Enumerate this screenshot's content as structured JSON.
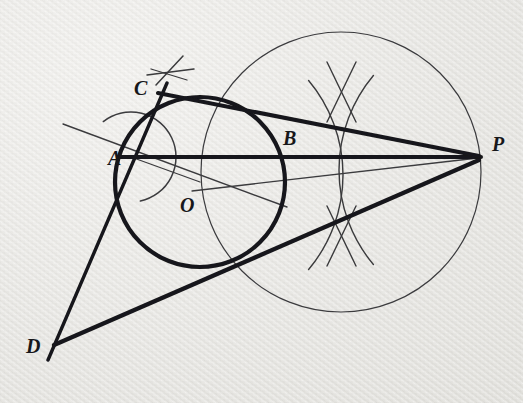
{
  "figure": {
    "kind": "geometry-construction-diagram",
    "background_color": "#ecebe8",
    "ink_color": "#1a1a1c",
    "thin_ink_color": "#3a3a3c"
  },
  "labels": [
    {
      "id": "C",
      "text": "C",
      "x": 134,
      "y": 78,
      "size": 20
    },
    {
      "id": "A",
      "text": "A",
      "x": 108,
      "y": 148,
      "size": 20
    },
    {
      "id": "B",
      "text": "B",
      "x": 283,
      "y": 128,
      "size": 20
    },
    {
      "id": "O",
      "text": "O",
      "x": 180,
      "y": 195,
      "size": 20
    },
    {
      "id": "P",
      "text": "P",
      "x": 492,
      "y": 134,
      "size": 20
    },
    {
      "id": "D",
      "text": "D",
      "x": 26,
      "y": 336,
      "size": 20
    }
  ],
  "points": {
    "A": {
      "x": 131,
      "y": 157
    },
    "B": {
      "x": 285,
      "y": 157
    },
    "O": {
      "x": 200,
      "y": 182
    },
    "C": {
      "x": 158,
      "y": 93
    },
    "D": {
      "x": 54,
      "y": 345
    },
    "P": {
      "x": 478,
      "y": 157
    }
  },
  "circles": [
    {
      "id": "main-circle",
      "name": "circle-O",
      "cx": 200,
      "cy": 182,
      "r": 85,
      "stroke_width": 4.2,
      "stroke": "#16161a",
      "style": "bold"
    },
    {
      "id": "auxiliary-circle",
      "name": "circle-on-OP-diameter",
      "cx": 341,
      "cy": 172,
      "r": 140,
      "stroke_width": 1.2,
      "stroke": "#3b3b3e",
      "style": "thin"
    }
  ],
  "segments": [
    {
      "id": "line-AP",
      "name": "diameter-line-A-to-P",
      "x1": 118,
      "y1": 157,
      "x2": 481,
      "y2": 157,
      "w": 4.0,
      "stroke": "#16161a"
    },
    {
      "id": "line-CP",
      "name": "tangent-line-C-to-P",
      "x1": 158,
      "y1": 93,
      "x2": 479,
      "y2": 156,
      "w": 4.0,
      "stroke": "#16161a"
    },
    {
      "id": "line-DP",
      "name": "tangent-line-D-to-P",
      "x1": 54,
      "y1": 345,
      "x2": 479,
      "y2": 160,
      "w": 4.2,
      "stroke": "#16161a"
    },
    {
      "id": "line-CD",
      "name": "secant-line-C-through-A-to-D",
      "x1": 167,
      "y1": 83,
      "x2": 48,
      "y2": 360,
      "w": 3.4,
      "stroke": "#16161a"
    },
    {
      "id": "line-OP-thin",
      "name": "thin-line-O-to-P",
      "x1": 192,
      "y1": 191,
      "x2": 478,
      "y2": 158,
      "w": 1.3,
      "stroke": "#3b3b3e"
    },
    {
      "id": "line-OA-thin",
      "name": "thin-line-O-to-A",
      "x1": 200,
      "y1": 182,
      "x2": 131,
      "y2": 157,
      "w": 1.3,
      "stroke": "#3b3b3e"
    },
    {
      "id": "line-through-A-thin",
      "name": "thin-ray-through-A",
      "x1": 63,
      "y1": 124,
      "x2": 287,
      "y2": 207,
      "w": 1.4,
      "stroke": "#3b3b3e"
    }
  ],
  "construction_arcs": [
    {
      "id": "arc-at-A",
      "name": "compass-arc-centred-at-A",
      "cx": 131,
      "cy": 157,
      "r": 45,
      "start_deg": -128,
      "end_deg": 78,
      "w": 1.5,
      "stroke": "#3b3b3e"
    }
  ],
  "construction_crosses": [
    {
      "id": "cross-above-C",
      "name": "compass-intersection-mark-above-C",
      "strokes": [
        {
          "x1": 147,
          "y1": 75,
          "x2": 194,
          "y2": 69,
          "w": 1.5
        },
        {
          "x1": 156,
          "y1": 85,
          "x2": 183,
          "y2": 56,
          "w": 1.5
        },
        {
          "x1": 151,
          "y1": 69,
          "x2": 187,
          "y2": 80,
          "w": 1.3
        }
      ]
    }
  ],
  "bisector_arcs": {
    "id": "perpendicular-bisector-lens",
    "name": "perpendicular-bisector-construction-arcs",
    "arcs": [
      {
        "cx": 196,
        "cy": 175,
        "r": 147,
        "start_deg": -40,
        "end_deg": 40,
        "w": 1.4
      },
      {
        "cx": 486,
        "cy": 170,
        "r": 147,
        "start_deg": 140,
        "end_deg": 220,
        "w": 1.4
      }
    ],
    "strokes": [
      {
        "x1": 327,
        "y1": 62,
        "x2": 356,
        "y2": 122,
        "w": 1.4
      },
      {
        "x1": 356,
        "y1": 62,
        "x2": 327,
        "y2": 122,
        "w": 1.4
      },
      {
        "x1": 327,
        "y1": 206,
        "x2": 356,
        "y2": 266,
        "w": 1.4
      },
      {
        "x1": 356,
        "y1": 206,
        "x2": 327,
        "y2": 266,
        "w": 1.4
      }
    ]
  }
}
